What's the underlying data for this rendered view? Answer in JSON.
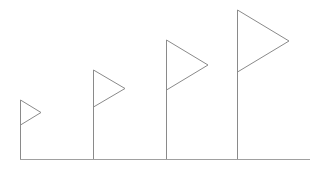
{
  "diagram": {
    "stroke_color": "#8a8a8a",
    "baseline_color": "#a0a0a0",
    "background": "#ffffff",
    "baseline": {
      "x1": 20,
      "x2": 310,
      "y": 159.5
    },
    "flags": [
      {
        "pole_x": 20.5,
        "pole_top": 100,
        "tip_x": 41,
        "tip_y": 112.5,
        "flag_bottom": 125
      },
      {
        "pole_x": 93.5,
        "pole_top": 70,
        "tip_x": 125,
        "tip_y": 88.5,
        "flag_bottom": 107
      },
      {
        "pole_x": 166.5,
        "pole_top": 40,
        "tip_x": 208,
        "tip_y": 65,
        "flag_bottom": 90
      },
      {
        "pole_x": 237.5,
        "pole_top": 10,
        "tip_x": 289,
        "tip_y": 41,
        "flag_bottom": 72
      }
    ]
  }
}
